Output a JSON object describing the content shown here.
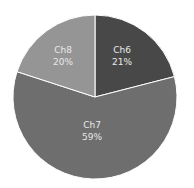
{
  "chart_data": {
    "type": "pie",
    "title": "",
    "categories": [
      "Ch6",
      "Ch7",
      "Ch8"
    ],
    "values": [
      21,
      59,
      20
    ],
    "labels": [
      "21%",
      "59%",
      "20%"
    ],
    "colors": [
      "#484848",
      "#6e6e6e",
      "#959595"
    ],
    "start_angle_deg": 0,
    "direction": "clockwise",
    "legend": "none"
  },
  "slices": [
    {
      "name": "Ch6",
      "pct": "21%"
    },
    {
      "name": "Ch7",
      "pct": "59%"
    },
    {
      "name": "Ch8",
      "pct": "20%"
    }
  ]
}
